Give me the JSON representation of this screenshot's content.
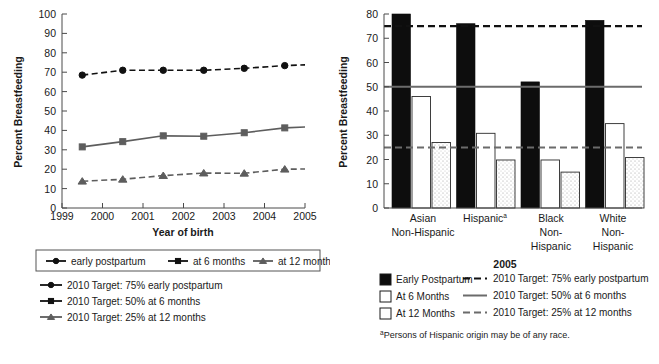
{
  "chart_data": [
    {
      "id": "left",
      "type": "line",
      "title": "",
      "xlabel": "Year of birth",
      "ylabel": "Percent Breastfeeding",
      "ylim": [
        0,
        100
      ],
      "ytick_step": 10,
      "yticks": [
        0,
        10,
        20,
        30,
        40,
        50,
        60,
        70,
        80,
        90,
        100
      ],
      "xticks": [
        "1999",
        "2000",
        "2001",
        "2002",
        "2003",
        "2004",
        "2005"
      ],
      "x": [
        1999.5,
        2000.5,
        2001.5,
        2002.5,
        2003.5,
        2004.5,
        2005.5
      ],
      "grid": false,
      "legend_position": "below",
      "series": [
        {
          "name": "early postpartum",
          "values": [
            68.5,
            71.0,
            71.0,
            71.0,
            72.0,
            73.4,
            74.2
          ],
          "color": "#111111",
          "line": "dashed",
          "marker": "circle"
        },
        {
          "name": "at 6 months",
          "values": [
            31.5,
            34.2,
            37.2,
            37.0,
            38.8,
            41.3,
            42.2
          ],
          "color": "#5d5d5d",
          "line": "solid",
          "marker": "square"
        },
        {
          "name": "at 12 months",
          "values": [
            13.8,
            14.8,
            16.7,
            18.0,
            17.9,
            20.0,
            20.2
          ],
          "color": "#5d5d5d",
          "line": "dashed",
          "marker": "triangle"
        }
      ],
      "legend_top": [
        {
          "label": "early postpartum",
          "marker": "circle",
          "color": "#111111"
        },
        {
          "label": "at 6 months",
          "marker": "square",
          "color": "#111111"
        },
        {
          "label": "at 12 months",
          "marker": "triangle",
          "color": "#5d5d5d"
        }
      ],
      "legend_targets": [
        {
          "label": "2010 Target: 75% early postpartum",
          "marker": "circle",
          "color": "#111111"
        },
        {
          "label": "2010 Target: 50% at 6 months",
          "marker": "square",
          "color": "#111111"
        },
        {
          "label": "2010 Target: 25% at 12 months",
          "marker": "triangle",
          "color": "#5d5d5d"
        }
      ]
    },
    {
      "id": "right",
      "type": "bar",
      "title": "",
      "xlabel": "2005",
      "ylabel": "Percent Breastfeeding",
      "ylim": [
        0,
        80
      ],
      "ytick_step": 10,
      "yticks": [
        0,
        10,
        20,
        30,
        40,
        50,
        60,
        70,
        80
      ],
      "categories": [
        "Asian Non-Hispanic",
        "Hispanicᵃ",
        "Black Non-Hispanic",
        "White Non-Hispanic"
      ],
      "category_lines": [
        [
          "Asian",
          "Non-Hispanic"
        ],
        [
          "Hispanic",
          "",
          ""
        ],
        [
          "Black",
          "Non-",
          "Hispanic"
        ],
        [
          "White",
          "Non-",
          "Hispanic"
        ]
      ],
      "grid": false,
      "legend_position": "below",
      "series": [
        {
          "name": "Early Postpartum",
          "values": [
            80.0,
            76.0,
            52.0,
            77.4
          ],
          "swatch": "solid-black"
        },
        {
          "name": "At 6 Months",
          "values": [
            46.0,
            30.8,
            19.8,
            34.8
          ],
          "swatch": "open-white"
        },
        {
          "name": "At 12 Months",
          "values": [
            27.0,
            19.8,
            14.8,
            20.8
          ],
          "swatch": "open-dotted"
        }
      ],
      "reference_lines": [
        {
          "label": "2010 Target: 75% early postpartum",
          "value": 75,
          "style": "dashed",
          "color": "#111111"
        },
        {
          "label": "2010 Target: 50% at 6 months",
          "value": 50,
          "style": "solid",
          "color": "#6b6b6b"
        },
        {
          "label": "2010 Target: 25% at 12 months",
          "value": 25,
          "style": "dashed",
          "color": "#6b6b6b"
        }
      ],
      "footnote": "ᵃPersons of Hispanic origin may be of any race."
    }
  ],
  "left": {
    "ylabel": "Percent Breastfeeding",
    "xlabel": "Year of birth",
    "yticks": [
      "100",
      "90",
      "80",
      "70",
      "60",
      "50",
      "40",
      "30",
      "20",
      "10",
      "0"
    ],
    "xticks": [
      "1999",
      "2000",
      "2001",
      "2002",
      "2003",
      "2004",
      "2005"
    ],
    "legend_top": [
      "early postpartum",
      "at 6 months",
      "at 12 months"
    ],
    "legend_targets": [
      "2010 Target: 75% early postpartum",
      "2010 Target: 50% at 6 months",
      "2010 Target: 25% at 12 months"
    ]
  },
  "right": {
    "ylabel": "Percent Breastfeeding",
    "xlabel": "2005",
    "yticks": [
      "80",
      "70",
      "60",
      "50",
      "40",
      "30",
      "20",
      "10",
      "0"
    ],
    "cat1": [
      "Asian",
      "Non-Hispanic"
    ],
    "cat2": [
      "Hispanic",
      "a"
    ],
    "cat3": [
      "Black",
      "Non-",
      "Hispanic"
    ],
    "cat4": [
      "White",
      "Non-",
      "Hispanic"
    ],
    "legend_swatches": [
      "Early Postpartum",
      "At 6 Months",
      "At 12 Months"
    ],
    "legend_lines": [
      "2010 Target: 75% early postpartum",
      "2010 Target: 50% at 6 months",
      "2010 Target: 25% at 12 months"
    ],
    "footnote": "Persons of Hispanic origin may be of any race.",
    "footnote_mark": "a"
  }
}
